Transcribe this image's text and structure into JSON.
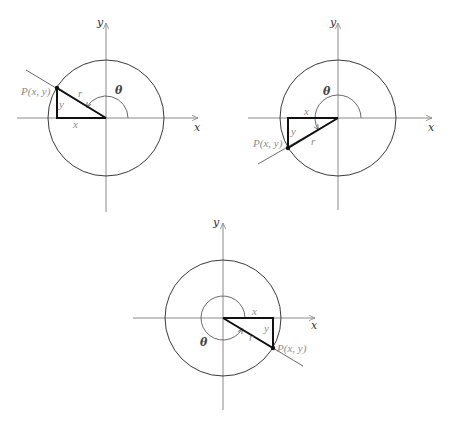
{
  "figure": {
    "colors": {
      "axis": "#8a8a8a",
      "circle": "#3a3a3a",
      "triangle": "#111111",
      "label_gray": "#8c8c8c"
    }
  },
  "diagrams": [
    {
      "id": "quadrant-II",
      "center": [
        106,
        118
      ],
      "radius": 58,
      "x_axis": {
        "from": 17,
        "to": 198,
        "label": "x"
      },
      "y_axis": {
        "from": 23,
        "to": 212,
        "label": "y"
      },
      "point": [
        57,
        88
      ],
      "ray_end": [
        26,
        70
      ],
      "arc": {
        "radius": 22,
        "start_deg": 0,
        "end_deg": 150
      },
      "labels": {
        "point": "P(x, y)",
        "x_side": "x",
        "y_side": "y",
        "hyp": "r",
        "angle": "θ"
      },
      "label_pos": {
        "point": [
          21,
          95
        ],
        "x_side": [
          73,
          128
        ],
        "y_side": [
          59,
          108
        ],
        "hyp": [
          78,
          97
        ],
        "angle": [
          115,
          94
        ],
        "x_axis": [
          194,
          131
        ],
        "y_axis": [
          97,
          26
        ]
      }
    },
    {
      "id": "quadrant-III",
      "center": [
        338,
        118
      ],
      "radius": 58,
      "x_axis": {
        "from": 248,
        "to": 432,
        "label": "x"
      },
      "y_axis": {
        "from": 23,
        "to": 210,
        "label": "y"
      },
      "point": [
        288,
        148
      ],
      "ray_end": [
        258,
        164
      ],
      "arc": {
        "radius": 23,
        "start_deg": 0,
        "end_deg": 210
      },
      "labels": {
        "point": "P(x, y)",
        "x_side": "x",
        "y_side": "y",
        "hyp": "r",
        "angle": "θ"
      },
      "label_pos": {
        "point": [
          253,
          147
        ],
        "x_side": [
          304,
          115
        ],
        "y_side": [
          291,
          135
        ],
        "hyp": [
          311,
          145
        ],
        "angle": [
          323,
          95
        ],
        "x_axis": [
          428,
          131
        ],
        "y_axis": [
          330,
          26
        ]
      }
    },
    {
      "id": "quadrant-IV",
      "center": [
        223,
        318
      ],
      "radius": 58,
      "x_axis": {
        "from": 133,
        "to": 315,
        "label": "x"
      },
      "y_axis": {
        "from": 223,
        "to": 410,
        "label": "y"
      },
      "point": [
        273,
        348
      ],
      "ray_end": [
        303,
        366
      ],
      "arc": {
        "radius": 22,
        "start_deg": 0,
        "end_deg": 330
      },
      "labels": {
        "point": "P(x, y)",
        "x_side": "x",
        "y_side": "y",
        "hyp": "r",
        "angle": "θ"
      },
      "label_pos": {
        "point": [
          277,
          352
        ],
        "x_side": [
          252,
          315
        ],
        "y_side": [
          264,
          332
        ],
        "hyp": [
          249,
          341
        ],
        "angle": [
          200,
          346
        ],
        "x_axis": [
          311,
          329
        ],
        "y_axis": [
          213,
          226
        ]
      }
    }
  ]
}
